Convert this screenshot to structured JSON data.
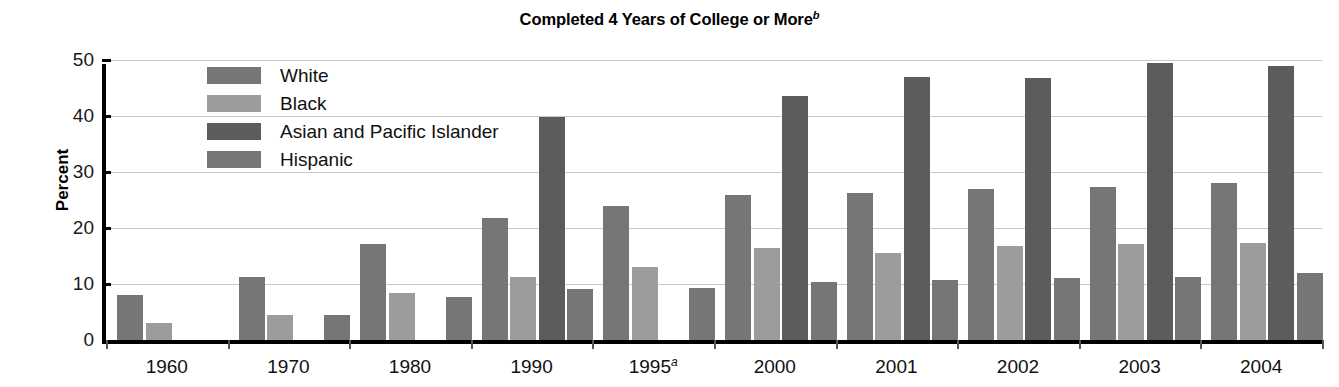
{
  "chart_data": {
    "type": "bar",
    "title": "Completed 4 Years of College or More",
    "title_superscript": "b",
    "xlabel": "",
    "ylabel": "Percent",
    "ylim": [
      0,
      50
    ],
    "yticks": [
      0,
      10,
      20,
      30,
      40,
      50
    ],
    "grid": true,
    "legend_position": "inside-top-left",
    "categories": [
      "1960",
      "1970",
      "1980",
      "1990",
      "1995",
      "2000",
      "2001",
      "2002",
      "2003",
      "2004"
    ],
    "category_superscripts": [
      "",
      "",
      "",
      "",
      "a",
      "",
      "",
      "",
      "",
      ""
    ],
    "series": [
      {
        "name": "White",
        "color": "#767676",
        "values": [
          8.1,
          11.3,
          17.1,
          21.8,
          24.0,
          25.9,
          26.3,
          27.0,
          27.4,
          28.0
        ]
      },
      {
        "name": "Black",
        "color": "#9c9c9c",
        "values": [
          3.1,
          4.4,
          8.4,
          11.2,
          13.0,
          16.4,
          15.6,
          16.8,
          17.1,
          17.3
        ]
      },
      {
        "name": "Asian and Pacific Islander",
        "color": "#5c5c5c",
        "values": [
          null,
          null,
          null,
          39.8,
          null,
          43.5,
          47.0,
          46.8,
          49.4,
          48.9
        ]
      },
      {
        "name": "Hispanic",
        "color": "#767676",
        "values": [
          null,
          4.5,
          7.6,
          9.1,
          9.3,
          10.4,
          10.8,
          11.0,
          11.2,
          12.0
        ]
      }
    ]
  },
  "legend": {
    "items": [
      {
        "label": "White"
      },
      {
        "label": "Black"
      },
      {
        "label": "Asian and Pacific Islander"
      },
      {
        "label": "Hispanic"
      }
    ]
  }
}
